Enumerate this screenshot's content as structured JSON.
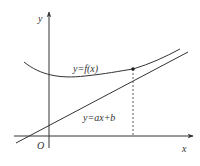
{
  "diagram": {
    "type": "function-graph",
    "axes": {
      "x_label": "x",
      "y_label": "y",
      "origin_label": "O"
    },
    "curves": [
      {
        "id": "curve",
        "label": "y=f(x)",
        "style": "solid"
      },
      {
        "id": "line",
        "label": "y=ax+b",
        "style": "solid"
      }
    ],
    "tangent_point": {
      "marker": "dot",
      "projection": "dashed-vertical-to-x-axis"
    },
    "colors": {
      "stroke": "#333333",
      "background": "#ffffff"
    }
  }
}
